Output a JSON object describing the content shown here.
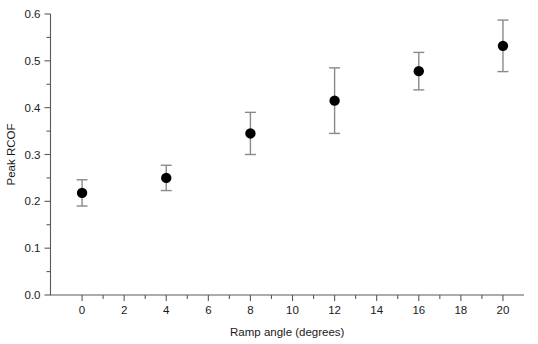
{
  "chart_data": {
    "type": "scatter",
    "title": "",
    "xlabel": "Ramp angle (degrees)",
    "ylabel": "Peak RCOF",
    "xlim": [
      -1.5,
      21.0
    ],
    "ylim": [
      0.0,
      0.6
    ],
    "grid": false,
    "legend": null,
    "x": [
      0,
      4,
      8,
      12,
      16,
      20
    ],
    "values": [
      0.218,
      0.25,
      0.345,
      0.415,
      0.478,
      0.532
    ],
    "errors": [
      0.028,
      0.027,
      0.045,
      0.07,
      0.04,
      0.055
    ],
    "points": [
      {
        "x": 0,
        "y": 0.218,
        "err": 0.028,
        "low": 0.19,
        "high": 0.246
      },
      {
        "x": 4,
        "y": 0.25,
        "err": 0.027,
        "low": 0.223,
        "high": 0.277
      },
      {
        "x": 8,
        "y": 0.345,
        "err": 0.045,
        "low": 0.3,
        "high": 0.39
      },
      {
        "x": 12,
        "y": 0.415,
        "err": 0.07,
        "low": 0.345,
        "high": 0.485
      },
      {
        "x": 16,
        "y": 0.478,
        "err": 0.04,
        "low": 0.438,
        "high": 0.518
      },
      {
        "x": 20,
        "y": 0.532,
        "err": 0.055,
        "low": 0.477,
        "high": 0.587
      }
    ],
    "x_ticks": [
      0,
      2,
      4,
      6,
      8,
      10,
      12,
      14,
      16,
      18,
      20
    ],
    "x_tick_labels": [
      "0",
      "2",
      "4",
      "6",
      "8",
      "10",
      "12",
      "14",
      "16",
      "18",
      "20"
    ],
    "x_minor_ticks": [
      1,
      3,
      5,
      7,
      9,
      11,
      13,
      15,
      17,
      19
    ],
    "y_ticks": [
      0.0,
      0.1,
      0.2,
      0.3,
      0.4,
      0.5,
      0.6
    ],
    "y_tick_labels": [
      "0.0",
      "0.1",
      "0.2",
      "0.3",
      "0.4",
      "0.5",
      "0.6"
    ],
    "y_minor_ticks": [
      0.05,
      0.15,
      0.25,
      0.35,
      0.45,
      0.55
    ],
    "marker_color": "#000000",
    "errorbar_color": "#8a8a8a",
    "axis_color": "#5a5a5a",
    "text_color": "#1a1a1a"
  }
}
